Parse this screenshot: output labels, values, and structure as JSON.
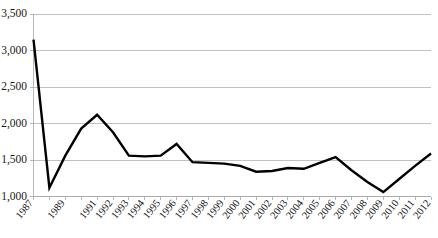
{
  "chart_data": {
    "type": "line",
    "title": "",
    "subtitle": "",
    "xlabel": "",
    "ylabel": "",
    "grid": "horizontal",
    "legend": "none",
    "ylim": [
      1000,
      3500
    ],
    "ytick_step": 500,
    "ytick_labels": [
      "3,500",
      "3,000",
      "2,500",
      "2,000",
      "1,500",
      "1,000"
    ],
    "ytick_values": [
      3500,
      3000,
      2500,
      2000,
      1500,
      1000
    ],
    "categories": [
      "1987",
      "1988",
      "1989",
      "1990",
      "1991",
      "1992",
      "1993",
      "1994",
      "1995",
      "1996",
      "1997",
      "1998",
      "1999",
      "2000",
      "2001",
      "2002",
      "2003",
      "2004",
      "2005",
      "2006",
      "2007",
      "2008",
      "2009",
      "2010",
      "2011",
      "2012"
    ],
    "xtick_labels": [
      "1987",
      "1989",
      "1991",
      "1992",
      "1993",
      "1994",
      "1995",
      "1996",
      "1997",
      "1998",
      "1999",
      "2000",
      "2001",
      "2002",
      "2003",
      "2004",
      "2005",
      "2006",
      "2007",
      "2008",
      "2009",
      "2010",
      "2011",
      "2012"
    ],
    "values": [
      3150,
      1120,
      1560,
      1930,
      2120,
      1880,
      1560,
      1550,
      1560,
      1720,
      1470,
      1460,
      1450,
      1420,
      1340,
      1350,
      1390,
      1380,
      1460,
      1540,
      1360,
      1200,
      1060,
      1240,
      1420,
      1590
    ],
    "series": [
      {
        "name": "series-1",
        "color": "#000000",
        "values": [
          3150,
          1120,
          1560,
          1930,
          2120,
          1880,
          1560,
          1550,
          1560,
          1720,
          1470,
          1460,
          1450,
          1420,
          1340,
          1350,
          1390,
          1380,
          1460,
          1540,
          1360,
          1200,
          1060,
          1240,
          1420,
          1590
        ]
      }
    ]
  },
  "colors": {
    "line": "#000000",
    "grid": "#a6a6a6",
    "axis": "#a6a6a6",
    "background": "#ffffff",
    "text": "#1a1a1a"
  }
}
